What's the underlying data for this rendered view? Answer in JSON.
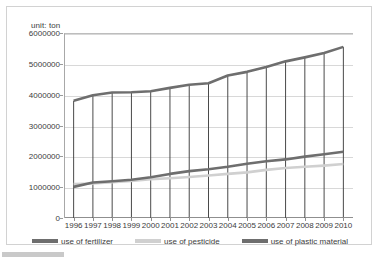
{
  "unit_label": "unit: ton",
  "colors": {
    "fertilizer": "#6e6e6e",
    "pesticide": "#d0d0d0",
    "plastic": "#6e6e6e",
    "droplines": "#4a4a4a",
    "gridlines": "#d8d8d8",
    "axis": "#8f8f8f",
    "border": "#d2d2d2",
    "text": "#3c3c3c"
  },
  "legend": {
    "items": [
      {
        "label": "use of fertilizer",
        "color": "#6e6e6e"
      },
      {
        "label": "use of pesticide",
        "color": "#d0d0d0"
      },
      {
        "label": "use of plastic material",
        "color": "#6e6e6e"
      }
    ]
  },
  "chart_data": {
    "type": "line",
    "title": "",
    "subtitle": "",
    "xlabel": "",
    "ylabel": "unit: ton",
    "grid": true,
    "legend_position": "bottom",
    "categories": [
      "1996",
      "1997",
      "1998",
      "1999",
      "2000",
      "2001",
      "2002",
      "2003",
      "2004",
      "2005",
      "2006",
      "2007",
      "2008",
      "2009",
      "2010"
    ],
    "ytick_labels": [
      "0",
      "1000000",
      "2000000",
      "3000000",
      "4000000",
      "5000000",
      "6000000"
    ],
    "yticks": [
      0,
      1000000,
      2000000,
      3000000,
      4000000,
      5000000,
      6000000
    ],
    "ylim": [
      0,
      6000000
    ],
    "series": [
      {
        "name": "use of fertilizer",
        "color": "#6e6e6e",
        "values": [
          3800000,
          3980000,
          4070000,
          4080000,
          4110000,
          4220000,
          4320000,
          4370000,
          4620000,
          4740000,
          4900000,
          5080000,
          5210000,
          5350000,
          5550000
        ]
      },
      {
        "name": "use of pesticide",
        "color": "#d0d0d0",
        "values": [
          1100000,
          1120000,
          1160000,
          1200000,
          1260000,
          1290000,
          1330000,
          1380000,
          1430000,
          1480000,
          1560000,
          1620000,
          1660000,
          1700000,
          1750000
        ]
      },
      {
        "name": "use of plastic material",
        "color": "#6e6e6e",
        "values": [
          1010000,
          1150000,
          1190000,
          1240000,
          1320000,
          1430000,
          1520000,
          1580000,
          1660000,
          1760000,
          1840000,
          1900000,
          1990000,
          2070000,
          2150000
        ]
      }
    ]
  }
}
